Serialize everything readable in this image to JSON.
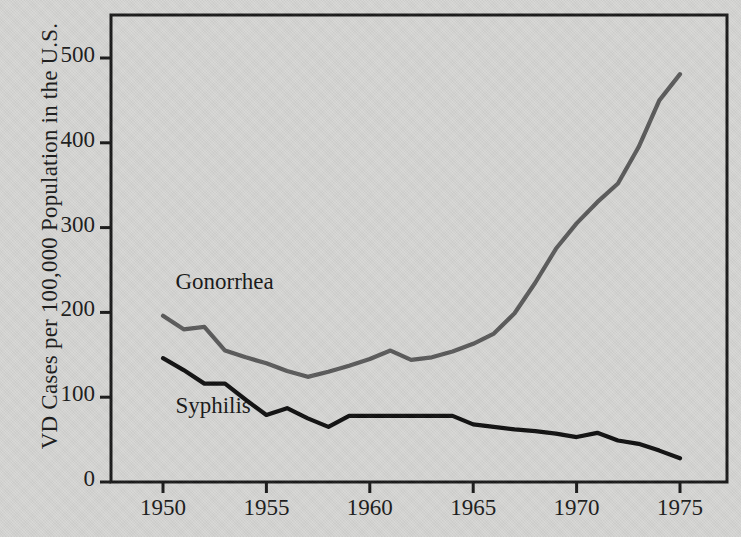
{
  "chart_data": {
    "type": "line",
    "title": "",
    "xlabel": "",
    "ylabel": "VD Cases per 100,000 Population in the U.S.",
    "xlim": [
      1950,
      1975
    ],
    "ylim": [
      0,
      540
    ],
    "grid": false,
    "legend_position": "inline-labels",
    "xticks": [
      1950,
      1955,
      1960,
      1965,
      1970,
      1975
    ],
    "xtick_labels": [
      "1950",
      "1955",
      "1960",
      "1965",
      "1970",
      "1975"
    ],
    "yticks": [
      0,
      100,
      200,
      300,
      400,
      500
    ],
    "ytick_labels": [
      "0",
      "100",
      "200",
      "300",
      "400",
      "500"
    ],
    "x": [
      1950,
      1951,
      1952,
      1953,
      1954,
      1955,
      1956,
      1957,
      1958,
      1959,
      1960,
      1961,
      1962,
      1963,
      1964,
      1965,
      1966,
      1967,
      1968,
      1969,
      1970,
      1971,
      1972,
      1973,
      1974,
      1975
    ],
    "series": [
      {
        "name": "Gonorrhea",
        "color": "#5b5b5b",
        "label_x": 1950.6,
        "label_y": 232,
        "values": [
          196,
          180,
          183,
          155,
          147,
          140,
          131,
          124,
          130,
          137,
          145,
          155,
          144,
          147,
          154,
          163,
          175,
          199,
          235,
          275,
          305,
          330,
          352,
          395,
          450,
          481
        ]
      },
      {
        "name": "Syphilis",
        "color": "#101010",
        "label_x": 1950.6,
        "label_y": 86,
        "values": [
          146,
          132,
          116,
          116,
          97,
          79,
          87,
          75,
          65,
          78,
          78,
          78,
          78,
          78,
          78,
          68,
          65,
          62,
          60,
          57,
          53,
          58,
          49,
          45,
          37,
          28
        ]
      }
    ],
    "annotations": []
  },
  "figure": {
    "background_color": "#d7d7d5",
    "frame_color": "#1a1a1a"
  }
}
